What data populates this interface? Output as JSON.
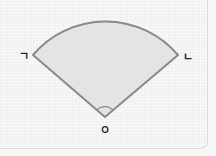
{
  "diagram": {
    "type": "circular-sector",
    "labels": {
      "left_point": "ㄱ",
      "right_point": "ㄴ",
      "center": "ㅇ"
    },
    "colors": {
      "fill": "#e4e4e4",
      "stroke": "#8a8a8a",
      "background": "#f1f1f1"
    },
    "central_angle_marked": true
  }
}
